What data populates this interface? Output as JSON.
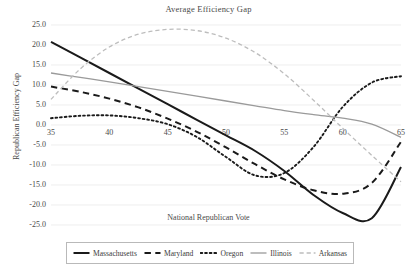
{
  "chart_data": {
    "type": "line",
    "title": "Average Efficiency Gap",
    "xlabel": "National Republican Vote",
    "ylabel": "Republican Efficiency Gap",
    "xlim": [
      35,
      65
    ],
    "ylim": [
      -25,
      25
    ],
    "xticks": [
      "35",
      "40",
      "45",
      "50",
      "55",
      "60",
      "65"
    ],
    "yticks": [
      "25.0",
      "20.0",
      "15.0",
      "10.0",
      "5.0",
      "0.0",
      "-5.0",
      "-10.0",
      "-15.0",
      "-20.0",
      "-25.0"
    ],
    "grid": true,
    "legend_position": "bottom",
    "x": [
      35,
      37.5,
      40,
      42.5,
      45,
      47.5,
      50,
      52.5,
      55,
      57.5,
      60,
      62.5,
      65
    ],
    "series": [
      {
        "name": "Massachusetts",
        "style": "solid",
        "color": "#1a1a1a",
        "values": [
          20.8,
          16.9,
          13.0,
          9.1,
          5.2,
          1.3,
          -2.6,
          -6.5,
          -11.5,
          -17.5,
          -22.0,
          -23.3,
          -10.5
        ]
      },
      {
        "name": "Maryland",
        "style": "dashed",
        "color": "#1a1a1a",
        "values": [
          9.6,
          8.3,
          6.6,
          4.4,
          1.6,
          -1.7,
          -5.6,
          -9.8,
          -13.6,
          -16.3,
          -17.2,
          -14.5,
          -4.2
        ]
      },
      {
        "name": "Oregon",
        "style": "dotted",
        "color": "#1a1a1a",
        "values": [
          1.7,
          2.3,
          2.4,
          1.7,
          0.2,
          -3.0,
          -8.0,
          -12.6,
          -12.0,
          -5.5,
          4.5,
          10.6,
          12.2
        ]
      },
      {
        "name": "Illinois",
        "style": "solid",
        "color": "#9a9a9a",
        "values": [
          13.0,
          11.9,
          10.8,
          9.6,
          8.4,
          7.2,
          6.0,
          4.8,
          3.6,
          2.6,
          1.7,
          0.2,
          -3.1
        ]
      },
      {
        "name": "Arkansas",
        "style": "dashed",
        "color": "#bdbdbd",
        "values": [
          6.4,
          14.0,
          19.5,
          22.7,
          23.9,
          23.6,
          21.7,
          18.1,
          12.8,
          6.2,
          -0.8,
          -7.6,
          -14.2
        ]
      }
    ]
  },
  "legend": {
    "items": [
      {
        "label": "Massachusetts"
      },
      {
        "label": "Maryland"
      },
      {
        "label": "Oregon"
      },
      {
        "label": "Illinois"
      },
      {
        "label": "Arkansas"
      }
    ]
  }
}
